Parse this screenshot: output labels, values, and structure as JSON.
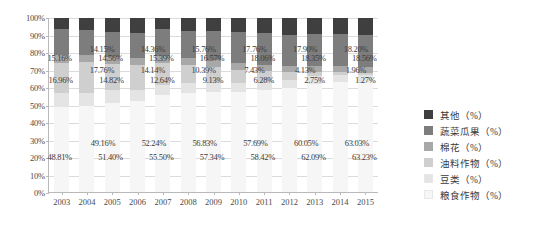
{
  "chart_data": {
    "type": "bar",
    "stacked": true,
    "stack_mode": "percent",
    "title": "",
    "xlabel": "",
    "ylabel": "",
    "ylim": [
      0,
      100
    ],
    "ytick_labels": [
      "100%",
      "90%",
      "80%",
      "70%",
      "60%",
      "50%",
      "40%",
      "30%",
      "20%",
      "10%",
      "0%"
    ],
    "ytick_values": [
      100,
      90,
      80,
      70,
      60,
      50,
      40,
      30,
      20,
      10,
      0
    ],
    "grid": true,
    "legend_position": "right",
    "categories": [
      "2003",
      "2004",
      "2005",
      "2006",
      "2007",
      "2008",
      "2009",
      "2010",
      "2011",
      "2012",
      "2013",
      "2014",
      "2015"
    ],
    "series": [
      {
        "name": "粮食作物（%）",
        "color": "#f6f6f6",
        "values": [
          48.81,
          49.16,
          51.4,
          52.24,
          55.5,
          56.83,
          57.34,
          57.69,
          58.42,
          60.05,
          62.09,
          63.03,
          63.23
        ],
        "labels": [
          "48.81%",
          "49.16%",
          "51.40%",
          "52.24%",
          "55.50%",
          "56.83%",
          "57.34%",
          "57.69%",
          "58.42%",
          "60.05%",
          "62.09%",
          "63.03%",
          "63.23%"
        ]
      },
      {
        "name": "豆类（%）",
        "color": "#e4e4e4",
        "values": [
          8.2,
          7.6,
          7.1,
          6.6,
          6.2,
          5.8,
          5.5,
          5.2,
          4.9,
          4.6,
          4.4,
          4.2,
          4.1
        ],
        "labels": [
          "",
          "",
          "",
          "",
          "",
          "",
          "",
          "",
          "",
          "",
          "",
          "",
          ""
        ]
      },
      {
        "name": "油料作物（%）",
        "color": "#cfcfcf",
        "values": [
          16.96,
          17.76,
          14.82,
          14.14,
          12.64,
          10.39,
          9.13,
          7.43,
          6.28,
          4.13,
          2.75,
          1.96,
          1.27
        ],
        "labels": [
          "16.96%",
          "17.76%",
          "14.82%",
          "14.14%",
          "12.64%",
          "10.39%",
          "9.13%",
          "7.43%",
          "6.28%",
          "4.13%",
          "2.75%",
          "1.96%",
          "1.27%"
        ]
      },
      {
        "name": "棉花（%）",
        "color": "#a8a8a8",
        "values": [
          4.6,
          4.5,
          4.3,
          4.2,
          4.0,
          3.9,
          3.8,
          3.7,
          3.6,
          3.5,
          3.4,
          3.3,
          3.2
        ],
        "labels": [
          "",
          "",
          "",
          "",
          "",
          "",
          "",
          "",
          "",
          "",
          "",
          "",
          ""
        ]
      },
      {
        "name": "蔬菜瓜果（%）",
        "color": "#7d7d7d",
        "values": [
          15.16,
          14.15,
          14.56,
          14.36,
          15.39,
          15.76,
          16.57,
          17.76,
          18.06,
          17.9,
          18.35,
          18.2,
          18.56
        ],
        "labels": [
          "15.16%",
          "14.15%",
          "14.56%",
          "14.36%",
          "15.39%",
          "15.76%",
          "16.57%",
          "17.76%",
          "18.06%",
          "17.90%",
          "18.35%",
          "18.20%",
          "18.56%"
        ]
      },
      {
        "name": "其他（%）",
        "color": "#3f3f3f",
        "values": [
          6.27,
          6.83,
          7.82,
          8.46,
          6.27,
          7.32,
          7.66,
          8.22,
          8.74,
          9.82,
          9.01,
          9.31,
          9.64
        ],
        "labels": [
          "",
          "",
          "",
          "",
          "",
          "",
          "",
          "",
          "",
          "",
          "",
          "",
          ""
        ]
      }
    ],
    "legend": [
      {
        "label": "其他（%）",
        "color": "#3f3f3f"
      },
      {
        "label": "蔬菜瓜果（%）",
        "color": "#7d7d7d"
      },
      {
        "label": "棉花（%）",
        "color": "#a8a8a8"
      },
      {
        "label": "油料作物（%）",
        "color": "#cfcfcf"
      },
      {
        "label": "豆类（%）",
        "color": "#e4e4e4"
      },
      {
        "label": "粮食作物（%）",
        "color": "#f6f6f6"
      }
    ]
  }
}
